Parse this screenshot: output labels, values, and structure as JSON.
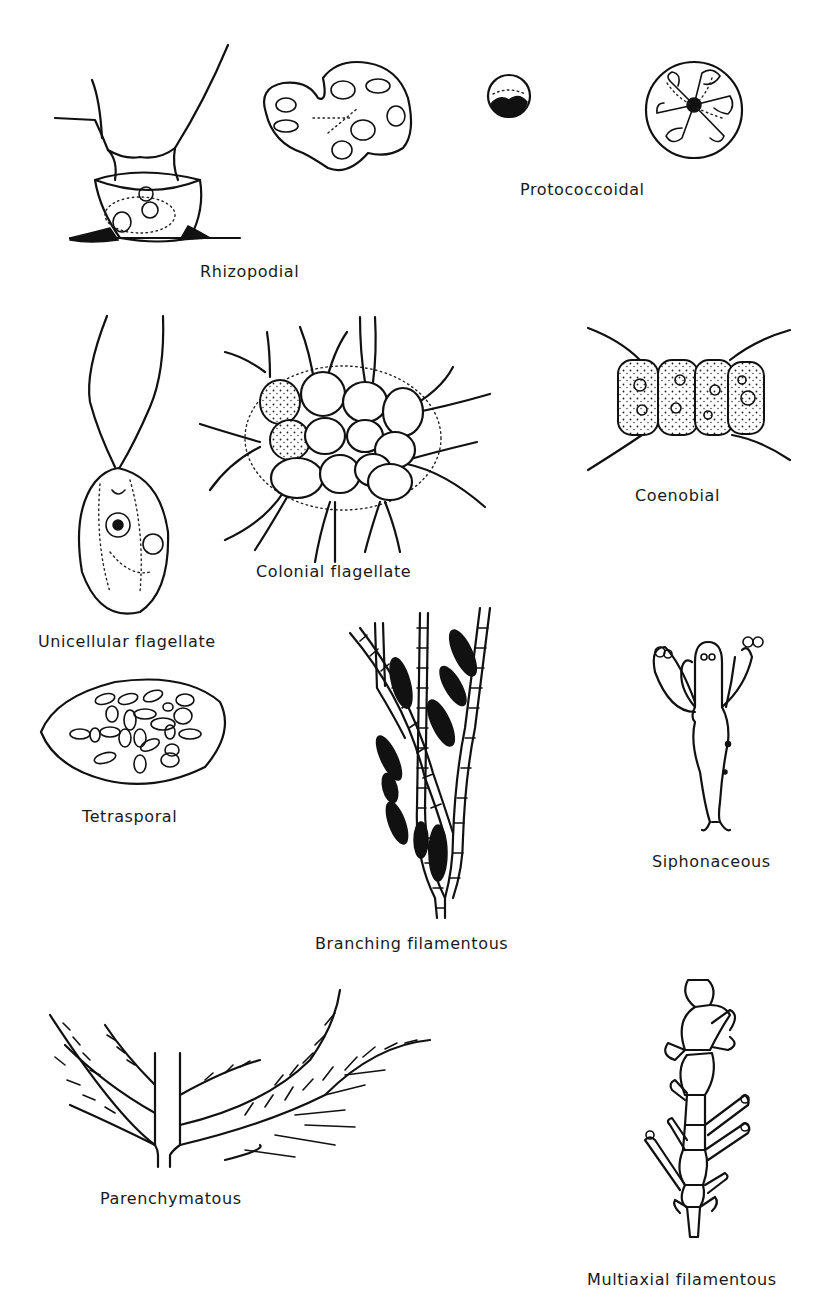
{
  "figure": {
    "type": "diagram",
    "panels": [
      {
        "id": "rhizopodial",
        "label": "Rhizopodial"
      },
      {
        "id": "protococcoidal",
        "label": "Protococcoidal"
      },
      {
        "id": "unicellular-flagellate",
        "label": "Unicellular flagellate"
      },
      {
        "id": "colonial-flagellate",
        "label": "Colonial flagellate"
      },
      {
        "id": "coenobial",
        "label": "Coenobial"
      },
      {
        "id": "tetrasporal",
        "label": "Tetrasporal"
      },
      {
        "id": "branching-filamentous",
        "label": "Branching filamentous"
      },
      {
        "id": "siphonaceous",
        "label": "Siphonaceous"
      },
      {
        "id": "parenchymatous",
        "label": "Parenchymatous"
      },
      {
        "id": "multiaxial-filamentous",
        "label": "Multiaxial filamentous"
      }
    ],
    "colors": {
      "ink": "#111111",
      "background": "#ffffff"
    }
  }
}
